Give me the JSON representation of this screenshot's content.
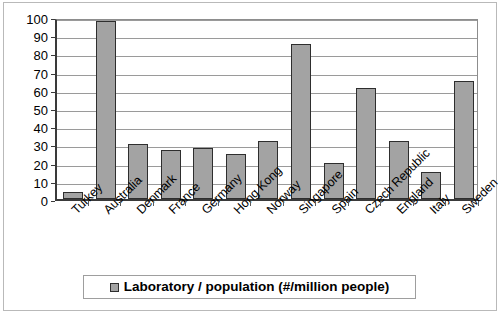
{
  "chart_data": {
    "type": "bar",
    "title": "",
    "xlabel": "",
    "ylabel": "",
    "ylim": [
      0,
      100
    ],
    "yticks": [
      0,
      10,
      20,
      30,
      40,
      50,
      60,
      70,
      80,
      90,
      100
    ],
    "grid": true,
    "legend_position": "bottom",
    "categories": [
      "Turkey",
      "Australia",
      "Denmark",
      "France",
      "Germany",
      "Hong Kong",
      "Norway",
      "Singapore",
      "Spain",
      "Czech Republic",
      "England",
      "Italy",
      "Sweden"
    ],
    "series": [
      {
        "name": "Laboratory / population (#/million people)",
        "values": [
          4,
          98,
          30,
          27,
          28,
          25,
          32,
          85,
          20,
          61,
          32,
          15,
          65
        ],
        "color": "#a3a3a3",
        "edge_color": "#2e2e2e"
      }
    ]
  },
  "legend": {
    "label": "Laboratory / population (#/million people)",
    "swatch_name": "legend-swatch-laboratory-population"
  }
}
